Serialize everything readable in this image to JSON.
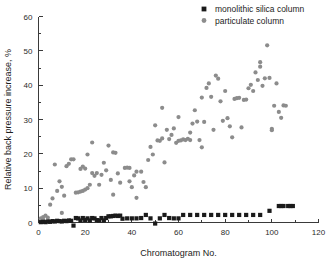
{
  "chart_data": {
    "type": "scatter",
    "title": "",
    "xlabel": "Chromatogram No.",
    "ylabel": "Relative back pressure increase, %",
    "xlim": [
      0,
      120
    ],
    "ylim": [
      0,
      60
    ],
    "xticks": [
      0,
      20,
      40,
      60,
      80,
      100,
      120
    ],
    "yticks": [
      0,
      10,
      20,
      30,
      40,
      50,
      60
    ],
    "grid": false,
    "legend_position": "top-right",
    "colors": {
      "monolithic_silica_column": "#1a1a1a",
      "particulate_column": "#8c8c8c",
      "axis": "#3a3a3a",
      "text": "#1c1c1c",
      "background": "#ffffff"
    },
    "series": [
      {
        "name": "monolithic silica column",
        "marker": "square",
        "color": "#1a1a1a",
        "points": [
          [
            1,
            0.1
          ],
          [
            2,
            0.2
          ],
          [
            3,
            0.1
          ],
          [
            4,
            0.3
          ],
          [
            5,
            0.2
          ],
          [
            6,
            0.4
          ],
          [
            7,
            0.3
          ],
          [
            8,
            0.5
          ],
          [
            9,
            0.4
          ],
          [
            10,
            0.3
          ],
          [
            11,
            0.5
          ],
          [
            12,
            0.4
          ],
          [
            13,
            0.6
          ],
          [
            14,
            0.5
          ],
          [
            15,
            -0.9
          ],
          [
            16,
            1.3
          ],
          [
            17,
            1.2
          ],
          [
            18,
            0.6
          ],
          [
            19,
            1.3
          ],
          [
            20,
            0.7
          ],
          [
            21,
            1.2
          ],
          [
            22,
            0.6
          ],
          [
            23,
            1.3
          ],
          [
            24,
            1.2
          ],
          [
            25,
            0.7
          ],
          [
            26,
            0.6
          ],
          [
            27,
            1.3
          ],
          [
            28,
            0.6
          ],
          [
            29,
            1.3
          ],
          [
            30,
            1.8
          ],
          [
            31,
            1.8
          ],
          [
            32,
            1.9
          ],
          [
            33,
            2.0
          ],
          [
            34,
            1.9
          ],
          [
            35,
            2.0
          ],
          [
            36,
            1.1
          ],
          [
            38,
            1.2
          ],
          [
            40,
            1.2
          ],
          [
            42,
            1.2
          ],
          [
            44,
            1.3
          ],
          [
            46,
            2.2
          ],
          [
            48,
            1.2
          ],
          [
            50,
            -0.3
          ],
          [
            52,
            1.2
          ],
          [
            54,
            2.2
          ],
          [
            56,
            1.3
          ],
          [
            58,
            1.2
          ],
          [
            60,
            1.2
          ],
          [
            62,
            2.2
          ],
          [
            65,
            2.2
          ],
          [
            68,
            2.2
          ],
          [
            71,
            2.2
          ],
          [
            74,
            2.2
          ],
          [
            77,
            2.2
          ],
          [
            80,
            2.2
          ],
          [
            83,
            2.2
          ],
          [
            86,
            2.2
          ],
          [
            89,
            2.2
          ],
          [
            92,
            2.2
          ],
          [
            95,
            2.2
          ],
          [
            99,
            3.4
          ],
          [
            103,
            4.8
          ],
          [
            104,
            4.8
          ],
          [
            105,
            4.8
          ],
          [
            107,
            4.8
          ],
          [
            108,
            4.8
          ],
          [
            109,
            4.8
          ]
        ]
      },
      {
        "name": "particulate column",
        "marker": "circle",
        "color": "#8c8c8c",
        "points": [
          [
            1,
            1.2
          ],
          [
            2,
            1.6
          ],
          [
            2,
            0.8
          ],
          [
            3,
            2.0
          ],
          [
            4,
            1.4
          ],
          [
            5,
            5.2
          ],
          [
            6,
            7.0
          ],
          [
            7,
            16.9
          ],
          [
            8,
            9.2
          ],
          [
            9,
            12.0
          ],
          [
            10,
            10.4
          ],
          [
            10,
            2.8
          ],
          [
            11,
            7.8
          ],
          [
            12,
            16.4
          ],
          [
            13,
            17.1
          ],
          [
            14,
            18.4
          ],
          [
            15,
            18.4
          ],
          [
            16,
            8.7
          ],
          [
            17,
            8.8
          ],
          [
            18,
            9.0
          ],
          [
            18,
            15.6
          ],
          [
            19,
            9.2
          ],
          [
            19,
            16.3
          ],
          [
            20,
            9.6
          ],
          [
            20,
            15.7
          ],
          [
            21,
            10.0
          ],
          [
            21,
            19.8
          ],
          [
            22,
            11.0
          ],
          [
            23,
            23.3
          ],
          [
            23,
            14.4
          ],
          [
            24,
            13.6
          ],
          [
            25,
            14.4
          ],
          [
            26,
            11.0
          ],
          [
            27,
            13.9
          ],
          [
            28,
            17.4
          ],
          [
            29,
            15.2
          ],
          [
            30,
            22.4
          ],
          [
            31,
            12.4
          ],
          [
            32,
            20.4
          ],
          [
            32,
            8.1
          ],
          [
            33,
            20.3
          ],
          [
            34,
            14.3
          ],
          [
            35,
            11.6
          ],
          [
            37,
            15.9
          ],
          [
            38,
            16.0
          ],
          [
            39,
            15.9
          ],
          [
            39,
            12.0
          ],
          [
            40,
            10.3
          ],
          [
            41,
            13.7
          ],
          [
            42,
            7.2
          ],
          [
            42,
            14.8
          ],
          [
            44,
            14.8
          ],
          [
            45,
            11.8
          ],
          [
            46,
            10.3
          ],
          [
            47,
            18.2
          ],
          [
            48,
            22.0
          ],
          [
            49,
            19.8
          ],
          [
            50,
            28.3
          ],
          [
            51,
            23.9
          ],
          [
            52,
            23.8
          ],
          [
            53,
            33.4
          ],
          [
            53,
            24.5
          ],
          [
            54,
            17.5
          ],
          [
            55,
            27.0
          ],
          [
            56,
            24.3
          ],
          [
            57,
            25.5
          ],
          [
            58,
            27.4
          ],
          [
            59,
            23.2
          ],
          [
            60,
            23.8
          ],
          [
            60,
            30.7
          ],
          [
            61,
            23.9
          ],
          [
            62,
            24.2
          ],
          [
            63,
            24.0
          ],
          [
            64,
            24.4
          ],
          [
            65,
            26.2
          ],
          [
            65,
            24.0
          ],
          [
            66,
            28.8
          ],
          [
            67,
            32.7
          ],
          [
            68,
            29.4
          ],
          [
            69,
            24.0
          ],
          [
            70,
            36.4
          ],
          [
            70,
            21.9
          ],
          [
            71,
            29.3
          ],
          [
            72,
            39.2
          ],
          [
            73,
            40.5
          ],
          [
            74,
            36.6
          ],
          [
            75,
            27.0
          ],
          [
            76,
            42.8
          ],
          [
            77,
            41.9
          ],
          [
            78,
            35.3
          ],
          [
            79,
            29.6
          ],
          [
            80,
            38.3
          ],
          [
            81,
            30.4
          ],
          [
            82,
            28.0
          ],
          [
            83,
            24.8
          ],
          [
            84,
            36.0
          ],
          [
            85,
            36.2
          ],
          [
            86,
            36.3
          ],
          [
            87,
            27.7
          ],
          [
            88,
            35.7
          ],
          [
            89,
            35.8
          ],
          [
            90,
            39.1
          ],
          [
            91,
            40.1
          ],
          [
            92,
            38.3
          ],
          [
            93,
            43.7
          ],
          [
            94,
            41.5
          ],
          [
            95,
            45.4
          ],
          [
            95,
            46.7
          ],
          [
            96,
            39.8
          ],
          [
            97,
            42.0
          ],
          [
            98,
            51.6
          ],
          [
            99,
            42.1
          ],
          [
            100,
            27.3
          ],
          [
            100,
            26.9
          ],
          [
            101,
            34.0
          ],
          [
            102,
            40.5
          ],
          [
            103,
            32.2
          ],
          [
            104,
            30.5
          ],
          [
            105,
            34.1
          ],
          [
            106,
            34.0
          ]
        ]
      }
    ]
  },
  "legend": {
    "items": [
      {
        "label": "monolithic silica column",
        "marker": "square",
        "color": "#1a1a1a"
      },
      {
        "label": "particulate column",
        "marker": "circle",
        "color": "#8c8c8c"
      }
    ]
  },
  "axes": {
    "x_title": "Chromatogram No.",
    "y_title": "Relative back pressure increase, %",
    "x_tick_labels": [
      "0",
      "20",
      "40",
      "60",
      "80",
      "100",
      "120"
    ],
    "y_tick_labels": [
      "0",
      "10",
      "20",
      "30",
      "40",
      "50",
      "60"
    ]
  }
}
